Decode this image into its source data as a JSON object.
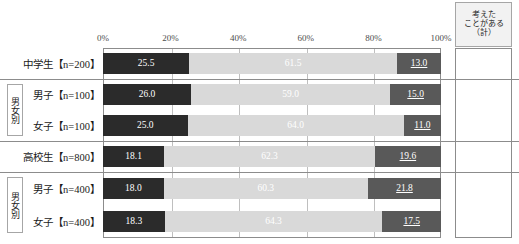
{
  "axis": {
    "ticks": [
      "0%",
      "20%",
      "40%",
      "60%",
      "80%",
      "100%"
    ]
  },
  "right_column": {
    "header_line1": "考えた",
    "header_line2": "ことがある",
    "header_line3": "（計）"
  },
  "group_tags": {
    "junior": "男女別",
    "senior": "男女別"
  },
  "rows": [
    {
      "label": "中学生【n=200】",
      "s0": "25.5",
      "s1": "61.5",
      "s2": "13.0",
      "total": "87.0"
    },
    {
      "label": "男子【n=100】",
      "s0": "26.0",
      "s1": "59.0",
      "s2": "15.0",
      "total": "85.0"
    },
    {
      "label": "女子【n=100】",
      "s0": "25.0",
      "s1": "64.0",
      "s2": "11.0",
      "total": "89.0"
    },
    {
      "label": "高校生【n=800】",
      "s0": "18.1",
      "s1": "62.3",
      "s2": "19.6",
      "total": "80.4"
    },
    {
      "label": "男子【n=400】",
      "s0": "18.0",
      "s1": "60.3",
      "s2": "21.8",
      "total": "78.3"
    },
    {
      "label": "女子【n=400】",
      "s0": "18.3",
      "s1": "64.3",
      "s2": "17.5",
      "total": "82.6"
    }
  ],
  "chart_data": {
    "type": "bar",
    "orientation": "horizontal",
    "stacked": true,
    "stacked_percent": true,
    "title": "",
    "xlabel": "",
    "ylabel": "",
    "xlim": [
      0,
      100
    ],
    "xticks": [
      0,
      20,
      40,
      60,
      80,
      100
    ],
    "xtick_labels": [
      "0%",
      "20%",
      "40%",
      "60%",
      "80%",
      "100%"
    ],
    "grid": true,
    "legend": false,
    "categories": [
      "中学生【n=200】",
      "男子【n=100】",
      "女子【n=100】",
      "高校生【n=800】",
      "男子【n=400】",
      "女子【n=400】"
    ],
    "series": [
      {
        "name": "segment-1-dark",
        "color": "#2b2b2b",
        "values": [
          25.5,
          26.0,
          25.0,
          18.1,
          18.0,
          18.3
        ]
      },
      {
        "name": "segment-2-light",
        "color": "#d9d9d9",
        "values": [
          61.5,
          59.0,
          64.0,
          62.3,
          60.3,
          64.3
        ]
      },
      {
        "name": "segment-3-mid",
        "color": "#595959",
        "values": [
          13.0,
          15.0,
          11.0,
          19.6,
          21.8,
          17.5
        ]
      }
    ],
    "annotation_column": {
      "header": "考えたことがある（計）",
      "values": [
        87.0,
        85.0,
        89.0,
        80.4,
        78.3,
        82.6
      ]
    }
  }
}
